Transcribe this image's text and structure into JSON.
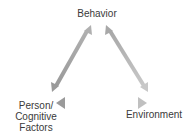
{
  "diagram": {
    "nodes": {
      "behavior": "Behavior",
      "person": "Person/\nCognitive\nFactors",
      "environment": "Environment"
    },
    "edges": [
      {
        "from": "behavior",
        "to": "person",
        "type": "bidirectional"
      },
      {
        "from": "behavior",
        "to": "environment",
        "type": "bidirectional"
      },
      {
        "from": "person",
        "to": "environment",
        "type": "bidirectional"
      }
    ],
    "colors": {
      "arrow_dark": "#9a9a9a",
      "arrow_light": "#c8c8c8",
      "text": "#3a3a3a"
    }
  }
}
